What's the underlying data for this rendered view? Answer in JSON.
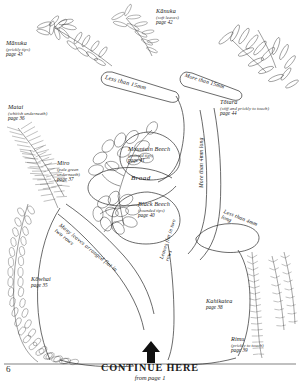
{
  "page": {
    "folio": "6",
    "continue_main": "CONTINUE HERE",
    "continue_sub": "from page 1",
    "arrow_icon": "up-arrow-icon"
  },
  "branch_labels": [
    {
      "id": "less-than-15mm",
      "text": "Less than 15mm"
    },
    {
      "id": "more-than-15mm",
      "text": "More than 15mm"
    },
    {
      "id": "broad",
      "text": "Broad"
    },
    {
      "id": "more-than-4mm",
      "text": "More than 4mm long"
    },
    {
      "id": "less-than-4mm",
      "text": "Less than 4mm long"
    },
    {
      "id": "many-leaves-flat-two-rows",
      "text": "Many leaves arranged flat in two rows"
    },
    {
      "id": "leaves-flat-two-rows",
      "text": "Leaves flat in two rows"
    }
  ],
  "species": [
    {
      "id": "manuka",
      "name": "Mānuka",
      "qualifier": "(prickly tips)",
      "page": "page 43"
    },
    {
      "id": "kanuka",
      "name": "Kānuka",
      "qualifier": "(soft leaves)",
      "page": "page 42"
    },
    {
      "id": "totara",
      "name": "Tōtara",
      "qualifier": "(stiff and prickly to touch)",
      "page": "page 44"
    },
    {
      "id": "matai",
      "name": "Matai",
      "qualifier": "(whitish underneath)",
      "page": "page 36"
    },
    {
      "id": "miro",
      "name": "Miro",
      "qualifier": "(pale green underneath)",
      "page": "page 37"
    },
    {
      "id": "mountain-beech",
      "name": "Mountain Beech",
      "qualifier": "(pointed tips)",
      "page": "page 41"
    },
    {
      "id": "black-beech",
      "name": "Black Beech",
      "qualifier": "(rounded tips)",
      "page": "page 40"
    },
    {
      "id": "kowhai",
      "name": "Kōwhai",
      "qualifier": "",
      "page": "page 35"
    },
    {
      "id": "kahikatea",
      "name": "Kahikatea",
      "qualifier": "",
      "page": "page 38"
    },
    {
      "id": "rimu",
      "name": "Rimu",
      "qualifier": "(prickly to touch)",
      "page": "page 39"
    }
  ],
  "colors": {
    "ink": "#1a1a1a",
    "line": "#2b2b2b",
    "paper": "#ffffff",
    "soft": "#555555"
  }
}
